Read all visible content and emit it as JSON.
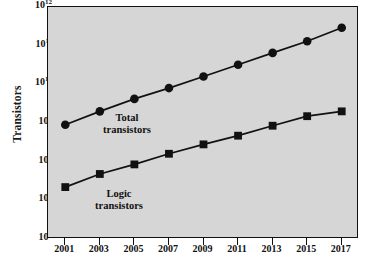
{
  "chart_data": {
    "type": "line",
    "title": "",
    "xlabel": "",
    "ylabel": "Transistors",
    "x": [
      2001,
      2003,
      2005,
      2007,
      2009,
      2011,
      2013,
      2015,
      2017
    ],
    "xtick_labels": [
      "2001",
      "2003",
      "2005",
      "2007",
      "2009",
      "2011",
      "2013",
      "2015",
      "2017"
    ],
    "xlim": [
      2000,
      2018
    ],
    "yscale": "log",
    "ylim": [
      1000000,
      1000000000000
    ],
    "ytick_labels": [
      "10^12",
      "10^11",
      "10^10",
      "10^9",
      "10^8",
      "10^7",
      "10^6"
    ],
    "ytick_mantissa": [
      "10",
      "10",
      "10",
      "10",
      "10",
      "10",
      "10"
    ],
    "ytick_exponent": [
      "12",
      "11",
      "10",
      "9",
      "8",
      "7",
      "6"
    ],
    "ytick_values": [
      1000000000000,
      100000000000,
      10000000000,
      1000000000,
      100000000,
      10000000,
      1000000
    ],
    "grid": false,
    "legend_position": "inline-annotation",
    "series": [
      {
        "name": "Total transistors",
        "label_line1": "Total",
        "label_line2": "transistors",
        "marker": "circle",
        "color": "#111111",
        "values": [
          900000000.0,
          2000000000.0,
          4200000000.0,
          8000000000.0,
          16000000000.0,
          32000000000.0,
          65000000000.0,
          130000000000.0,
          290000000000.0
        ]
      },
      {
        "name": "Logic transistors",
        "label_line1": "Logic",
        "label_line2": "transistors",
        "marker": "square",
        "color": "#111111",
        "values": [
          22000000.0,
          48000000.0,
          85000000.0,
          160000000.0,
          280000000.0,
          470000000.0,
          850000000.0,
          1500000000.0,
          2000000000.0
        ]
      }
    ],
    "plot_background": "#d6d6d6",
    "axis_color": "#111111"
  }
}
